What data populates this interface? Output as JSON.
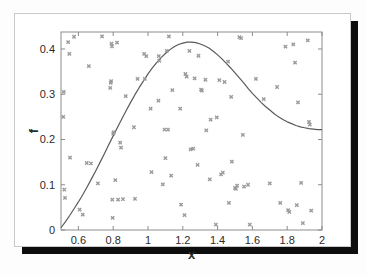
{
  "figure": {
    "background_color": "#ffffff",
    "card_border_color": "#c9c9c9",
    "shadow_color": "#0d0d0d"
  },
  "chart_data": {
    "type": "scatter",
    "title": "",
    "subtitle": "",
    "xlabel": "x",
    "ylabel": "f",
    "xlim": [
      0.5,
      2.0
    ],
    "ylim": [
      0.0,
      0.4375
    ],
    "xticks": [
      0.6,
      0.8,
      1.0,
      1.2,
      1.4,
      1.6,
      1.8,
      2.0
    ],
    "xticklabels": [
      "0.6",
      "0.8",
      "1",
      "1.2",
      "1.4",
      "1.6",
      "1.8",
      "2"
    ],
    "yticks": [
      0.0,
      0.1,
      0.2,
      0.3,
      0.4
    ],
    "yticklabels": [
      "0",
      "0.1",
      "0.2",
      "0.3",
      "0.4"
    ],
    "grid": false,
    "legend": null,
    "frame": "box",
    "marker_symbol": "x",
    "marker_color": "#9a9a9a",
    "marker_size": 3,
    "line_color": "#5a5a5a",
    "line_width": 1.2,
    "axis_color": "#8c8c8c",
    "series": [
      {
        "name": "envelope curve",
        "type": "line",
        "x": [
          0.5,
          0.525,
          0.55,
          0.575,
          0.6,
          0.625,
          0.65,
          0.675,
          0.7,
          0.725,
          0.75,
          0.775,
          0.8,
          0.825,
          0.85,
          0.875,
          0.9,
          0.925,
          0.95,
          0.975,
          1.0,
          1.025,
          1.05,
          1.075,
          1.1,
          1.125,
          1.15,
          1.175,
          1.2,
          1.225,
          1.25,
          1.275,
          1.3,
          1.325,
          1.35,
          1.375,
          1.4,
          1.425,
          1.45,
          1.475,
          1.5,
          1.525,
          1.55,
          1.575,
          1.6,
          1.625,
          1.65,
          1.675,
          1.7,
          1.725,
          1.75,
          1.775,
          1.8,
          1.825,
          1.85,
          1.875,
          1.9,
          1.925,
          1.95,
          1.975,
          2.0
        ],
        "y": [
          0.005,
          0.018,
          0.032,
          0.047,
          0.062,
          0.078,
          0.095,
          0.113,
          0.131,
          0.15,
          0.169,
          0.189,
          0.208,
          0.227,
          0.246,
          0.264,
          0.282,
          0.299,
          0.315,
          0.33,
          0.345,
          0.358,
          0.37,
          0.381,
          0.39,
          0.398,
          0.405,
          0.41,
          0.413,
          0.415,
          0.415,
          0.414,
          0.411,
          0.407,
          0.402,
          0.395,
          0.387,
          0.378,
          0.368,
          0.358,
          0.347,
          0.336,
          0.325,
          0.313,
          0.302,
          0.292,
          0.282,
          0.273,
          0.265,
          0.257,
          0.25,
          0.244,
          0.239,
          0.235,
          0.231,
          0.228,
          0.226,
          0.224,
          0.223,
          0.222,
          0.222
        ]
      },
      {
        "name": "samples",
        "type": "scatter",
        "points": [
          [
            0.513,
            0.25
          ],
          [
            0.516,
            0.305
          ],
          [
            0.519,
            0.089
          ],
          [
            0.523,
            0.071
          ],
          [
            0.541,
            0.415
          ],
          [
            0.548,
            0.389
          ],
          [
            0.552,
            0.16
          ],
          [
            0.575,
            0.427
          ],
          [
            0.607,
            0.045
          ],
          [
            0.625,
            0.034
          ],
          [
            0.648,
            0.148
          ],
          [
            0.66,
            0.362
          ],
          [
            0.672,
            0.147
          ],
          [
            0.712,
            0.103
          ],
          [
            0.736,
            0.428
          ],
          [
            0.783,
            0.314
          ],
          [
            0.786,
            0.325
          ],
          [
            0.788,
            0.329
          ],
          [
            0.79,
            0.412
          ],
          [
            0.793,
            0.406
          ],
          [
            0.795,
            0.067
          ],
          [
            0.797,
            0.027
          ],
          [
            0.8,
            0.213
          ],
          [
            0.803,
            0.216
          ],
          [
            0.812,
            0.11
          ],
          [
            0.822,
            0.414
          ],
          [
            0.828,
            0.067
          ],
          [
            0.84,
            0.193
          ],
          [
            0.845,
            0.182
          ],
          [
            0.856,
            0.068
          ],
          [
            0.872,
            0.296
          ],
          [
            0.919,
            0.227
          ],
          [
            0.925,
            0.069
          ],
          [
            0.94,
            0.334
          ],
          [
            0.978,
            0.389
          ],
          [
            0.982,
            0.334
          ],
          [
            0.99,
            0.384
          ],
          [
            1.015,
            0.268
          ],
          [
            1.02,
            0.128
          ],
          [
            1.06,
            0.286
          ],
          [
            1.062,
            0.384
          ],
          [
            1.065,
            0.374
          ],
          [
            1.085,
            0.101
          ],
          [
            1.095,
            0.222
          ],
          [
            1.1,
            0.159
          ],
          [
            1.108,
            0.396
          ],
          [
            1.115,
            0.222
          ],
          [
            1.12,
            0.428
          ],
          [
            1.133,
            0.12
          ],
          [
            1.14,
            0.309
          ],
          [
            1.185,
            0.268
          ],
          [
            1.19,
            0.056
          ],
          [
            1.21,
            0.033
          ],
          [
            1.215,
            0.345
          ],
          [
            1.222,
            0.339
          ],
          [
            1.238,
            0.396
          ],
          [
            1.245,
            0.178
          ],
          [
            1.26,
            0.18
          ],
          [
            1.268,
            0.335
          ],
          [
            1.285,
            0.144
          ],
          [
            1.29,
            0.385
          ],
          [
            1.305,
            0.31
          ],
          [
            1.31,
            0.308
          ],
          [
            1.33,
            0.332
          ],
          [
            1.335,
            0.22
          ],
          [
            1.355,
            0.112
          ],
          [
            1.36,
            0.244
          ],
          [
            1.39,
            0.012
          ],
          [
            1.395,
            0.249
          ],
          [
            1.41,
            0.331
          ],
          [
            1.42,
            0.123
          ],
          [
            1.43,
            0.127
          ],
          [
            1.44,
            0.327
          ],
          [
            1.46,
            0.372
          ],
          [
            1.465,
            0.06
          ],
          [
            1.478,
            0.294
          ],
          [
            1.482,
            0.151
          ],
          [
            1.5,
            0.093
          ],
          [
            1.505,
            0.091
          ],
          [
            1.512,
            0.098
          ],
          [
            1.525,
            0.426
          ],
          [
            1.535,
            0.424
          ],
          [
            1.545,
            0.21
          ],
          [
            1.552,
            0.096
          ],
          [
            1.575,
            0.1
          ],
          [
            1.585,
            0.012
          ],
          [
            1.62,
            0.334
          ],
          [
            1.665,
            0.289
          ],
          [
            1.7,
            0.103
          ],
          [
            1.742,
            0.316
          ],
          [
            1.76,
            0.06
          ],
          [
            1.79,
            0.405
          ],
          [
            1.805,
            0.044
          ],
          [
            1.812,
            0.04
          ],
          [
            1.835,
            0.41
          ],
          [
            1.845,
            0.37
          ],
          [
            1.855,
            0.055
          ],
          [
            1.862,
            0.282
          ],
          [
            1.88,
            0.104
          ],
          [
            1.89,
            0.015
          ],
          [
            1.918,
            0.419
          ],
          [
            1.925,
            0.239
          ],
          [
            1.93,
            0.233
          ],
          [
            1.938,
            0.043
          ]
        ]
      }
    ]
  }
}
